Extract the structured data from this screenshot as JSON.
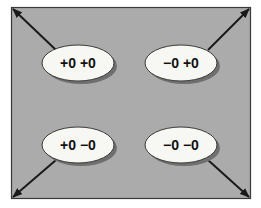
{
  "diagram": {
    "background_color": "#ababab",
    "border_color": "#3a3a3a",
    "ellipse_fill": "#f7f7f3",
    "ellipse_shadow": "#6f6f6f",
    "arrow_color": "#1a1a1a",
    "nodes": [
      {
        "label": "+0 +0",
        "position": "top-left",
        "arrow_to": "top-left-corner"
      },
      {
        "label": "−0 +0",
        "position": "top-right",
        "arrow_to": "top-right-corner"
      },
      {
        "label": "+0 −0",
        "position": "bottom-left",
        "arrow_to": "bottom-left-corner"
      },
      {
        "label": "−0 −0",
        "position": "bottom-right",
        "arrow_to": "bottom-right-corner"
      }
    ]
  }
}
